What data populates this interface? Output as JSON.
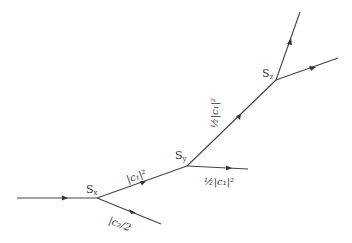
{
  "diagram": {
    "type": "beam splitter / Stern-Gerlach cascade",
    "nodes": [
      {
        "id": "Sx",
        "label": "S",
        "sub": "x",
        "x": 97,
        "y": 198
      },
      {
        "id": "Sy",
        "label": "S",
        "sub": "y",
        "x": 187,
        "y": 166
      },
      {
        "id": "Sz",
        "label": "S",
        "sub": "z",
        "x": 276,
        "y": 80
      }
    ],
    "edge_labels": {
      "sx_upper": "|c₁|²",
      "sx_lower": "|c₂/2",
      "sy_right": "½|c₁|²",
      "sy_up": "½|c₁|²"
    },
    "colors": {
      "line": "#444444",
      "text": "#333333",
      "background": "#ffffff"
    }
  }
}
